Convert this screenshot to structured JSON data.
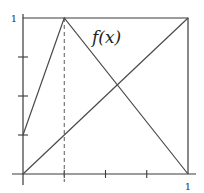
{
  "diagram": {
    "function_label": "f(x)",
    "x_axis": {
      "end_label": "1",
      "range": [
        0,
        1
      ],
      "ticks": [
        0.25,
        0.5,
        0.75
      ]
    },
    "y_axis": {
      "top_label": "1",
      "range": [
        0,
        1
      ],
      "ticks": [
        0.25,
        0.5,
        0.75
      ]
    },
    "function_points": [
      [
        0,
        0.25
      ],
      [
        0.25,
        1
      ],
      [
        1,
        0
      ]
    ],
    "diagonal_points": [
      [
        0,
        0
      ],
      [
        1,
        1
      ]
    ],
    "dashed_marker_x": 0.25,
    "frame": true
  }
}
